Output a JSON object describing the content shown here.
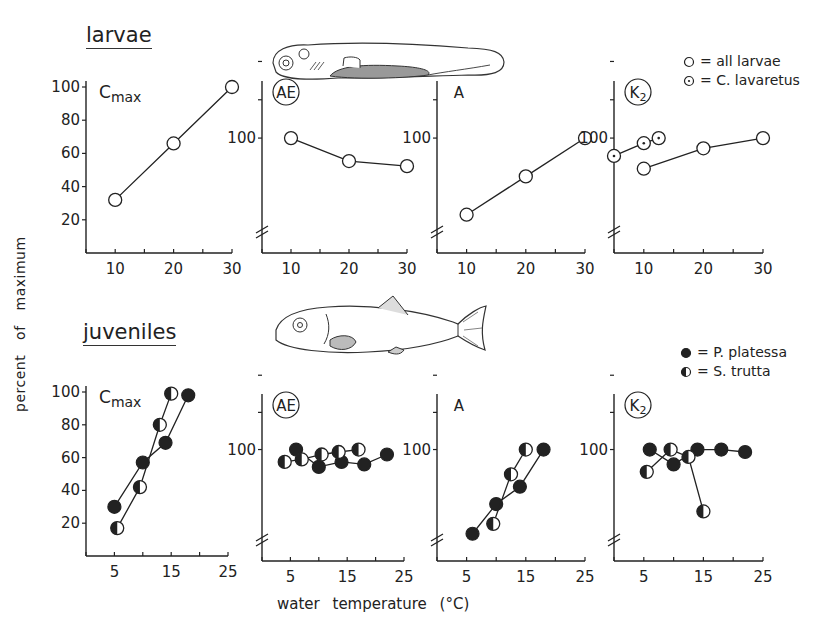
{
  "figure": {
    "y_axis_label": "percent of maximum",
    "x_axis_label": "water temperature (°C)",
    "colors": {
      "ink": "#222222",
      "background": "#ffffff"
    }
  },
  "sections": {
    "larvae": {
      "title": "larvae",
      "illustration": "larva-fish-drawing",
      "legend": [
        {
          "marker": "open-circle",
          "label": "= all larvae"
        },
        {
          "marker": "dotted-circle",
          "label": "= C. lavaretus"
        }
      ]
    },
    "juveniles": {
      "title": "juveniles",
      "illustration": "juvenile-fish-drawing",
      "legend": [
        {
          "marker": "filled-circle",
          "label": "= P. platessa"
        },
        {
          "marker": "half-filled-circle",
          "label": "= S. trutta"
        }
      ]
    }
  },
  "chart_data": [
    {
      "type": "line",
      "panel": "larvae-cmax",
      "title": "Cmax",
      "title_circled": false,
      "xlabel": "water temperature (°C)",
      "ylabel": "percent of maximum",
      "xlim": [
        5,
        30
      ],
      "xticks": [
        10,
        20,
        30
      ],
      "ylim": [
        0,
        100
      ],
      "yticks": [
        20,
        40,
        60,
        80,
        100
      ],
      "axis_break": false,
      "series": [
        {
          "name": "all larvae",
          "marker": "open",
          "x": [
            10,
            20,
            30
          ],
          "y": [
            32,
            66,
            100
          ]
        }
      ]
    },
    {
      "type": "line",
      "panel": "larvae-ae",
      "title": "AE",
      "title_circled": true,
      "xlim": [
        5,
        30
      ],
      "xticks": [
        10,
        20,
        30
      ],
      "ylim": [
        55,
        120
      ],
      "yticks": [
        100
      ],
      "axis_break": true,
      "series": [
        {
          "name": "all larvae",
          "marker": "open",
          "x": [
            10,
            20,
            30
          ],
          "y": [
            100,
            91,
            89
          ]
        }
      ]
    },
    {
      "type": "line",
      "panel": "larvae-a",
      "title": "A",
      "title_circled": false,
      "xlim": [
        5,
        30
      ],
      "xticks": [
        10,
        20,
        30
      ],
      "ylim": [
        55,
        120
      ],
      "yticks": [
        100
      ],
      "axis_break": true,
      "series": [
        {
          "name": "all larvae",
          "marker": "open",
          "x": [
            10,
            20,
            30
          ],
          "y": [
            70,
            85,
            100
          ]
        }
      ]
    },
    {
      "type": "line",
      "panel": "larvae-k2",
      "title": "K2",
      "title_circled": true,
      "xlim": [
        5,
        30
      ],
      "xticks": [
        10,
        20,
        30
      ],
      "ylim": [
        55,
        120
      ],
      "yticks": [
        100
      ],
      "axis_break": true,
      "series": [
        {
          "name": "all larvae",
          "marker": "open",
          "x": [
            10,
            20,
            30
          ],
          "y": [
            88,
            96,
            100
          ]
        },
        {
          "name": "C. lavaretus",
          "marker": "dotted",
          "x": [
            5,
            10,
            12.5
          ],
          "y": [
            93,
            98,
            100
          ]
        }
      ]
    },
    {
      "type": "line",
      "panel": "juveniles-cmax",
      "title": "Cmax",
      "title_circled": false,
      "xlim": [
        0,
        25
      ],
      "xticks": [
        5,
        15,
        25
      ],
      "ylim": [
        0,
        100
      ],
      "yticks": [
        20,
        40,
        60,
        80,
        100
      ],
      "axis_break": false,
      "series": [
        {
          "name": "P. platessa",
          "marker": "filled",
          "x": [
            5,
            10,
            14,
            18
          ],
          "y": [
            30,
            57,
            69,
            98
          ]
        },
        {
          "name": "S. trutta",
          "marker": "half",
          "x": [
            5.5,
            9.5,
            13,
            15
          ],
          "y": [
            17,
            42,
            80,
            99
          ]
        }
      ]
    },
    {
      "type": "line",
      "panel": "juveniles-ae",
      "title": "AE",
      "title_circled": true,
      "xlim": [
        0,
        25
      ],
      "xticks": [
        5,
        15,
        25
      ],
      "ylim": [
        55,
        120
      ],
      "yticks": [
        100
      ],
      "axis_break": true,
      "series": [
        {
          "name": "P. platessa",
          "marker": "filled",
          "x": [
            6,
            10,
            14,
            18,
            22
          ],
          "y": [
            100,
            93,
            95,
            94,
            98
          ]
        },
        {
          "name": "S. trutta",
          "marker": "half",
          "x": [
            4,
            7,
            10.5,
            13.5,
            17
          ],
          "y": [
            95,
            96,
            98,
            99,
            100
          ]
        }
      ]
    },
    {
      "type": "line",
      "panel": "juveniles-a",
      "title": "A",
      "title_circled": false,
      "xlim": [
        0,
        25
      ],
      "xticks": [
        5,
        15,
        25
      ],
      "ylim": [
        55,
        120
      ],
      "yticks": [
        100
      ],
      "axis_break": true,
      "series": [
        {
          "name": "P. platessa",
          "marker": "filled",
          "x": [
            6,
            10,
            14,
            18
          ],
          "y": [
            66,
            78,
            85,
            100
          ]
        },
        {
          "name": "S. trutta",
          "marker": "half",
          "x": [
            9.5,
            12.5,
            15
          ],
          "y": [
            70,
            90,
            100
          ]
        }
      ]
    },
    {
      "type": "line",
      "panel": "juveniles-k2",
      "title": "K2",
      "title_circled": true,
      "xlim": [
        0,
        25
      ],
      "xticks": [
        5,
        15,
        25
      ],
      "ylim": [
        55,
        120
      ],
      "yticks": [
        100
      ],
      "axis_break": true,
      "series": [
        {
          "name": "P. platessa",
          "marker": "filled",
          "x": [
            6,
            10,
            14,
            18,
            22
          ],
          "y": [
            100,
            94,
            100,
            100,
            99
          ]
        },
        {
          "name": "S. trutta",
          "marker": "half",
          "x": [
            5.5,
            9.5,
            12.5,
            15
          ],
          "y": [
            91,
            100,
            97,
            75
          ]
        }
      ]
    }
  ]
}
